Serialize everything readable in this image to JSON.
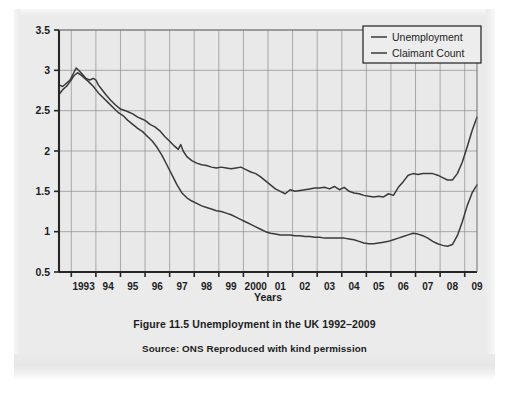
{
  "figure": {
    "caption": "Figure 11.5  Unemployment in the UK 1992–2009",
    "source": "Source: ONS Reproduced with kind permission"
  },
  "chart_data": {
    "type": "line",
    "title": "",
    "xlabel": "Years",
    "ylabel": "",
    "xlim": [
      1992.5,
      2009.5
    ],
    "ylim": [
      0.5,
      3.5
    ],
    "grid": true,
    "legend_position": "top-right",
    "ytick_labels": [
      "3.5",
      "3",
      "2.5",
      "2",
      "1.5",
      "1",
      "0.5"
    ],
    "ytick_values": [
      3.5,
      3,
      2.5,
      2,
      1.5,
      1,
      0.5
    ],
    "xtick_labels": [
      "1993",
      "94",
      "95",
      "96",
      "97",
      "98",
      "99",
      "2000",
      "01",
      "02",
      "03",
      "04",
      "05",
      "06",
      "07",
      "08",
      "09"
    ],
    "xtick_values": [
      1993,
      1994,
      1995,
      1996,
      1997,
      1998,
      1999,
      2000,
      2001,
      2002,
      2003,
      2004,
      2005,
      2006,
      2007,
      2008,
      2009
    ],
    "series": [
      {
        "name": "Unemployment",
        "color": "#3a3a3a",
        "x": [
          1992.5,
          1992.65,
          1992.8,
          1992.95,
          1993.1,
          1993.2,
          1993.3,
          1993.45,
          1993.6,
          1993.75,
          1993.9,
          1994.0,
          1994.1,
          1994.25,
          1994.4,
          1994.6,
          1994.8,
          1995.0,
          1995.2,
          1995.35,
          1995.5,
          1995.7,
          1995.85,
          1996.0,
          1996.2,
          1996.4,
          1996.6,
          1996.8,
          1997.0,
          1997.2,
          1997.35,
          1997.45,
          1997.55,
          1997.7,
          1997.9,
          1998.1,
          1998.3,
          1998.5,
          1998.7,
          1998.9,
          1999.1,
          1999.3,
          1999.5,
          1999.7,
          1999.9,
          2000.1,
          2000.3,
          2000.5,
          2000.7,
          2000.9,
          2001.1,
          2001.3,
          2001.5,
          2001.7,
          2001.9,
          2002.1,
          2002.3,
          2002.5,
          2002.7,
          2002.9,
          2003.1,
          2003.3,
          2003.5,
          2003.7,
          2003.9,
          2004.1,
          2004.3,
          2004.5,
          2004.7,
          2004.9,
          2005.1,
          2005.3,
          2005.5,
          2005.7,
          2005.9,
          2006.1,
          2006.3,
          2006.5,
          2006.7,
          2006.9,
          2007.1,
          2007.3,
          2007.5,
          2007.7,
          2007.9,
          2008.1,
          2008.3,
          2008.5,
          2008.7,
          2008.9,
          2009.1,
          2009.3,
          2009.5
        ],
        "y": [
          2.82,
          2.8,
          2.84,
          2.88,
          2.97,
          3.03,
          3.0,
          2.95,
          2.9,
          2.88,
          2.9,
          2.88,
          2.82,
          2.76,
          2.7,
          2.63,
          2.57,
          2.52,
          2.5,
          2.48,
          2.46,
          2.42,
          2.4,
          2.38,
          2.33,
          2.3,
          2.25,
          2.18,
          2.12,
          2.06,
          2.02,
          2.08,
          2.0,
          1.93,
          1.88,
          1.85,
          1.83,
          1.82,
          1.8,
          1.79,
          1.8,
          1.79,
          1.78,
          1.79,
          1.8,
          1.77,
          1.74,
          1.72,
          1.68,
          1.63,
          1.58,
          1.53,
          1.5,
          1.47,
          1.52,
          1.5,
          1.51,
          1.52,
          1.53,
          1.54,
          1.54,
          1.55,
          1.53,
          1.56,
          1.52,
          1.55,
          1.5,
          1.48,
          1.47,
          1.45,
          1.44,
          1.43,
          1.44,
          1.43,
          1.47,
          1.45,
          1.55,
          1.62,
          1.7,
          1.72,
          1.71,
          1.72,
          1.72,
          1.72,
          1.7,
          1.67,
          1.64,
          1.64,
          1.72,
          1.86,
          2.05,
          2.25,
          2.42
        ]
      },
      {
        "name": "Claimant Count",
        "color": "#3a3a3a",
        "x": [
          1992.5,
          1992.65,
          1992.8,
          1992.95,
          1993.1,
          1993.25,
          1993.4,
          1993.55,
          1993.7,
          1993.9,
          1994.1,
          1994.3,
          1994.5,
          1994.7,
          1994.9,
          1995.1,
          1995.3,
          1995.5,
          1995.7,
          1995.9,
          1996.1,
          1996.3,
          1996.5,
          1996.7,
          1996.9,
          1997.1,
          1997.3,
          1997.5,
          1997.7,
          1997.9,
          1998.1,
          1998.3,
          1998.5,
          1998.7,
          1998.9,
          1999.1,
          1999.3,
          1999.5,
          1999.7,
          1999.9,
          2000.1,
          2000.3,
          2000.5,
          2000.7,
          2000.9,
          2001.1,
          2001.3,
          2001.5,
          2001.7,
          2001.9,
          2002.1,
          2002.3,
          2002.5,
          2002.7,
          2002.9,
          2003.1,
          2003.3,
          2003.5,
          2003.7,
          2003.9,
          2004.1,
          2004.3,
          2004.5,
          2004.7,
          2004.9,
          2005.1,
          2005.3,
          2005.5,
          2005.7,
          2005.9,
          2006.1,
          2006.3,
          2006.5,
          2006.7,
          2006.9,
          2007.1,
          2007.3,
          2007.5,
          2007.7,
          2007.9,
          2008.1,
          2008.3,
          2008.5,
          2008.7,
          2008.9,
          2009.1,
          2009.3,
          2009.5
        ],
        "y": [
          2.7,
          2.76,
          2.8,
          2.86,
          2.93,
          2.97,
          2.94,
          2.9,
          2.86,
          2.8,
          2.72,
          2.66,
          2.6,
          2.54,
          2.48,
          2.44,
          2.38,
          2.33,
          2.28,
          2.24,
          2.18,
          2.12,
          2.04,
          1.94,
          1.82,
          1.7,
          1.58,
          1.48,
          1.42,
          1.38,
          1.35,
          1.32,
          1.3,
          1.28,
          1.26,
          1.25,
          1.23,
          1.21,
          1.18,
          1.15,
          1.12,
          1.09,
          1.06,
          1.03,
          1.0,
          0.98,
          0.97,
          0.96,
          0.96,
          0.96,
          0.95,
          0.95,
          0.94,
          0.94,
          0.93,
          0.93,
          0.92,
          0.92,
          0.92,
          0.92,
          0.92,
          0.91,
          0.9,
          0.88,
          0.86,
          0.85,
          0.85,
          0.86,
          0.87,
          0.88,
          0.9,
          0.92,
          0.94,
          0.96,
          0.98,
          0.97,
          0.95,
          0.92,
          0.88,
          0.85,
          0.83,
          0.82,
          0.84,
          0.95,
          1.12,
          1.32,
          1.48,
          1.58
        ]
      }
    ]
  }
}
